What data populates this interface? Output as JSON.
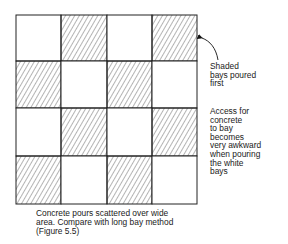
{
  "grid": {
    "rows": 4,
    "cols": 4,
    "pattern": [
      [
        "white",
        "shaded",
        "white",
        "shaded"
      ],
      [
        "shaded",
        "white",
        "shaded",
        "white"
      ],
      [
        "white",
        "shaded",
        "white",
        "shaded"
      ],
      [
        "shaded",
        "white",
        "shaded",
        "white"
      ]
    ],
    "line_color": "#222222",
    "hatch_color": "#444444"
  },
  "annotations": {
    "shaded": [
      "Shaded",
      "bays poured",
      "first"
    ],
    "access": [
      "Access for",
      "concrete",
      "to bay",
      "becomes",
      "very awkward",
      "when pouring",
      "the white",
      "bays"
    ]
  },
  "caption": {
    "lines": [
      "Concrete pours scattered over wide",
      "area. Compare with long bay method",
      "(Figure 5.5)"
    ]
  }
}
